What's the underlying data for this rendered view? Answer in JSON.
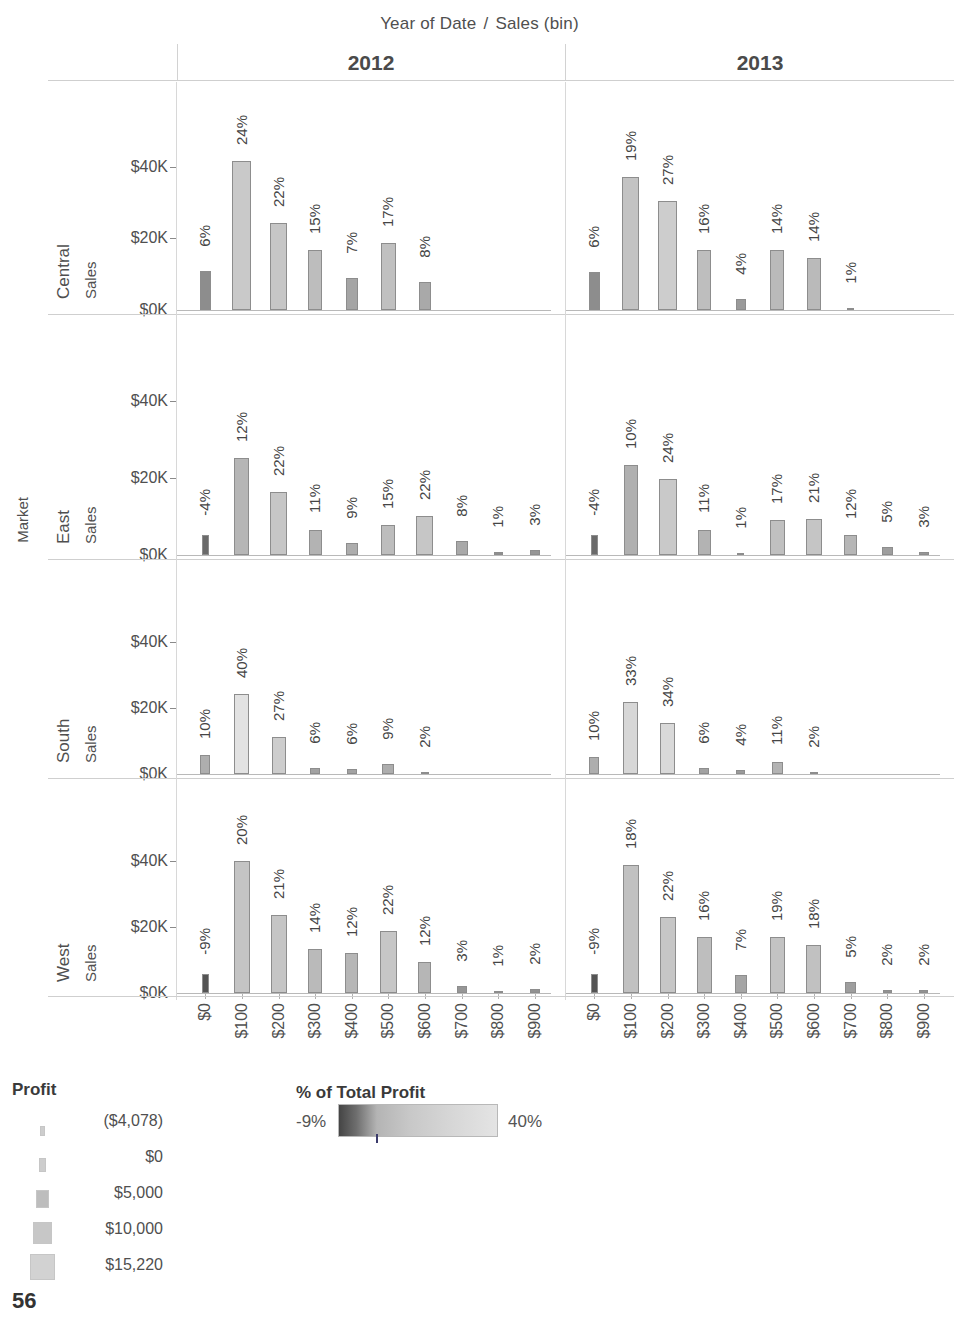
{
  "column_header": {
    "field_title": "Year of Date",
    "separator": "/",
    "bin_title": "Sales (bin)",
    "years": [
      "2012",
      "2013"
    ]
  },
  "row_header": {
    "field_title": "Market",
    "markets": [
      "Central",
      "East",
      "South",
      "West"
    ],
    "axis_title": "Sales"
  },
  "axes": {
    "y_ticks": [
      "$0K",
      "$20K",
      "$40K"
    ],
    "y_values": [
      0,
      20000,
      40000
    ],
    "x_ticks": [
      "$0",
      "$100",
      "$200",
      "$300",
      "$400",
      "$500",
      "$600",
      "$700",
      "$800",
      "$900"
    ]
  },
  "legend_profit": {
    "title": "Profit",
    "items": [
      {
        "label": "($4,078)",
        "width": 5
      },
      {
        "label": "$0",
        "width": 7
      },
      {
        "label": "$5,000",
        "width": 13
      },
      {
        "label": "$10,000",
        "width": 19
      },
      {
        "label": "$15,220",
        "width": 25
      }
    ]
  },
  "legend_color": {
    "title": "% of Total Profit",
    "min": "-9%",
    "max": "40%"
  },
  "page_number": "56",
  "chart_data": {
    "type": "bar",
    "xlabel": "Sales (bin)",
    "ylabel": "Sales",
    "ylim": [
      0,
      48000
    ],
    "grid": false,
    "legend_position": "bottom",
    "categories": [
      "$0",
      "$100",
      "$200",
      "$300",
      "$400",
      "$500",
      "$600",
      "$700",
      "$800",
      "$900"
    ],
    "row_field": "Market",
    "column_field": "Year of Date",
    "encodings": {
      "height": "Sales",
      "width": "Profit",
      "color": "% of Total Profit",
      "label": "% of Total Profit"
    },
    "panels": [
      {
        "market": "Central",
        "year": "2012",
        "bars": [
          {
            "x": "$0",
            "sales": 10800,
            "pct_label": "6%",
            "color": "#8d8d8d",
            "width": 11
          },
          {
            "x": "$100",
            "sales": 41500,
            "pct_label": "24%",
            "color": "#c9c9c9",
            "width": 19
          },
          {
            "x": "$200",
            "sales": 24200,
            "pct_label": "22%",
            "color": "#c6c6c6",
            "width": 17
          },
          {
            "x": "$300",
            "sales": 16700,
            "pct_label": "15%",
            "color": "#bdbdbd",
            "width": 14
          },
          {
            "x": "$400",
            "sales": 9000,
            "pct_label": "7%",
            "color": "#a5a5a5",
            "width": 12
          },
          {
            "x": "$500",
            "sales": 18800,
            "pct_label": "17%",
            "color": "#c0c0c0",
            "width": 15
          },
          {
            "x": "$600",
            "sales": 7800,
            "pct_label": "8%",
            "color": "#a9a9a9",
            "width": 12
          },
          {
            "x": "$700",
            "sales": 0,
            "pct_label": "",
            "color": "#bdbdbd",
            "width": 0
          },
          {
            "x": "$800",
            "sales": 0,
            "pct_label": "",
            "color": "#bdbdbd",
            "width": 0
          },
          {
            "x": "$900",
            "sales": 0,
            "pct_label": "",
            "color": "#bdbdbd",
            "width": 0
          }
        ]
      },
      {
        "market": "Central",
        "year": "2013",
        "bars": [
          {
            "x": "$0",
            "sales": 10500,
            "pct_label": "6%",
            "color": "#8d8d8d",
            "width": 11
          },
          {
            "x": "$100",
            "sales": 37200,
            "pct_label": "19%",
            "color": "#c3c3c3",
            "width": 17
          },
          {
            "x": "$200",
            "sales": 30500,
            "pct_label": "27%",
            "color": "#cdcdcd",
            "width": 19
          },
          {
            "x": "$300",
            "sales": 16700,
            "pct_label": "16%",
            "color": "#bebebe",
            "width": 14
          },
          {
            "x": "$400",
            "sales": 3000,
            "pct_label": "4%",
            "color": "#9a9a9a",
            "width": 10
          },
          {
            "x": "$500",
            "sales": 16700,
            "pct_label": "14%",
            "color": "#bababa",
            "width": 14
          },
          {
            "x": "$600",
            "sales": 14600,
            "pct_label": "14%",
            "color": "#bababa",
            "width": 14
          },
          {
            "x": "$700",
            "sales": 600,
            "pct_label": "1%",
            "color": "#8f8f8f",
            "width": 7
          },
          {
            "x": "$800",
            "sales": 0,
            "pct_label": "",
            "color": "#bdbdbd",
            "width": 0
          },
          {
            "x": "$900",
            "sales": 0,
            "pct_label": "",
            "color": "#bdbdbd",
            "width": 0
          }
        ]
      },
      {
        "market": "East",
        "year": "2012",
        "bars": [
          {
            "x": "$0",
            "sales": 5200,
            "pct_label": "-4%",
            "color": "#6a6a6a",
            "width": 7
          },
          {
            "x": "$100",
            "sales": 25200,
            "pct_label": "12%",
            "color": "#b6b6b6",
            "width": 15
          },
          {
            "x": "$200",
            "sales": 16300,
            "pct_label": "22%",
            "color": "#c6c6c6",
            "width": 17
          },
          {
            "x": "$300",
            "sales": 6400,
            "pct_label": "11%",
            "color": "#b3b3b3",
            "width": 13
          },
          {
            "x": "$400",
            "sales": 3000,
            "pct_label": "9%",
            "color": "#adadad",
            "width": 12
          },
          {
            "x": "$500",
            "sales": 7900,
            "pct_label": "15%",
            "color": "#bdbdbd",
            "width": 14
          },
          {
            "x": "$600",
            "sales": 10100,
            "pct_label": "22%",
            "color": "#c6c6c6",
            "width": 17
          },
          {
            "x": "$700",
            "sales": 3700,
            "pct_label": "8%",
            "color": "#a9a9a9",
            "width": 12
          },
          {
            "x": "$800",
            "sales": 800,
            "pct_label": "1%",
            "color": "#8f8f8f",
            "width": 9
          },
          {
            "x": "$900",
            "sales": 1300,
            "pct_label": "3%",
            "color": "#969696",
            "width": 10
          }
        ]
      },
      {
        "market": "East",
        "year": "2013",
        "bars": [
          {
            "x": "$0",
            "sales": 5300,
            "pct_label": "-4%",
            "color": "#6a6a6a",
            "width": 7
          },
          {
            "x": "$100",
            "sales": 23300,
            "pct_label": "10%",
            "color": "#b0b0b0",
            "width": 14
          },
          {
            "x": "$200",
            "sales": 19700,
            "pct_label": "24%",
            "color": "#c9c9c9",
            "width": 18
          },
          {
            "x": "$300",
            "sales": 6500,
            "pct_label": "11%",
            "color": "#b3b3b3",
            "width": 13
          },
          {
            "x": "$400",
            "sales": 600,
            "pct_label": "1%",
            "color": "#8f8f8f",
            "width": 7
          },
          {
            "x": "$500",
            "sales": 9100,
            "pct_label": "17%",
            "color": "#c0c0c0",
            "width": 15
          },
          {
            "x": "$600",
            "sales": 9400,
            "pct_label": "21%",
            "color": "#c5c5c5",
            "width": 16
          },
          {
            "x": "$700",
            "sales": 5300,
            "pct_label": "12%",
            "color": "#b6b6b6",
            "width": 13
          },
          {
            "x": "$800",
            "sales": 2000,
            "pct_label": "5%",
            "color": "#9e9e9e",
            "width": 11
          },
          {
            "x": "$900",
            "sales": 900,
            "pct_label": "3%",
            "color": "#969696",
            "width": 10
          }
        ]
      },
      {
        "market": "South",
        "year": "2012",
        "bars": [
          {
            "x": "$0",
            "sales": 5600,
            "pct_label": "10%",
            "color": "#aeaeae",
            "width": 10
          },
          {
            "x": "$100",
            "sales": 24200,
            "pct_label": "40%",
            "color": "#e2e2e2",
            "width": 15
          },
          {
            "x": "$200",
            "sales": 11300,
            "pct_label": "27%",
            "color": "#cdcdcd",
            "width": 14
          },
          {
            "x": "$300",
            "sales": 1700,
            "pct_label": "6%",
            "color": "#a2a2a2",
            "width": 10
          },
          {
            "x": "$400",
            "sales": 1600,
            "pct_label": "6%",
            "color": "#a2a2a2",
            "width": 10
          },
          {
            "x": "$500",
            "sales": 3000,
            "pct_label": "9%",
            "color": "#adadad",
            "width": 12
          },
          {
            "x": "$600",
            "sales": 500,
            "pct_label": "2%",
            "color": "#929292",
            "width": 8
          },
          {
            "x": "$700",
            "sales": 0,
            "pct_label": "",
            "color": "#bdbdbd",
            "width": 0
          },
          {
            "x": "$800",
            "sales": 0,
            "pct_label": "",
            "color": "#bdbdbd",
            "width": 0
          },
          {
            "x": "$900",
            "sales": 0,
            "pct_label": "",
            "color": "#bdbdbd",
            "width": 0
          }
        ]
      },
      {
        "market": "South",
        "year": "2013",
        "bars": [
          {
            "x": "$0",
            "sales": 5200,
            "pct_label": "10%",
            "color": "#aeaeae",
            "width": 10
          },
          {
            "x": "$100",
            "sales": 21600,
            "pct_label": "33%",
            "color": "#d7d7d7",
            "width": 15
          },
          {
            "x": "$200",
            "sales": 15500,
            "pct_label": "34%",
            "color": "#d9d9d9",
            "width": 15
          },
          {
            "x": "$300",
            "sales": 1800,
            "pct_label": "6%",
            "color": "#a2a2a2",
            "width": 10
          },
          {
            "x": "$400",
            "sales": 1100,
            "pct_label": "4%",
            "color": "#9a9a9a",
            "width": 9
          },
          {
            "x": "$500",
            "sales": 3500,
            "pct_label": "11%",
            "color": "#b3b3b3",
            "width": 11
          },
          {
            "x": "$600",
            "sales": 400,
            "pct_label": "2%",
            "color": "#929292",
            "width": 8
          },
          {
            "x": "$700",
            "sales": 0,
            "pct_label": "",
            "color": "#bdbdbd",
            "width": 0
          },
          {
            "x": "$800",
            "sales": 0,
            "pct_label": "",
            "color": "#bdbdbd",
            "width": 0
          },
          {
            "x": "$900",
            "sales": 0,
            "pct_label": "",
            "color": "#bdbdbd",
            "width": 0
          }
        ]
      },
      {
        "market": "West",
        "year": "2012",
        "bars": [
          {
            "x": "$0",
            "sales": 5800,
            "pct_label": "-9%",
            "color": "#545454",
            "width": 7
          },
          {
            "x": "$100",
            "sales": 39900,
            "pct_label": "20%",
            "color": "#c4c4c4",
            "width": 16
          },
          {
            "x": "$200",
            "sales": 23400,
            "pct_label": "21%",
            "color": "#c5c5c5",
            "width": 16
          },
          {
            "x": "$300",
            "sales": 13200,
            "pct_label": "14%",
            "color": "#bababa",
            "width": 14
          },
          {
            "x": "$400",
            "sales": 12200,
            "pct_label": "12%",
            "color": "#b6b6b6",
            "width": 13
          },
          {
            "x": "$500",
            "sales": 18600,
            "pct_label": "22%",
            "color": "#c6c6c6",
            "width": 17
          },
          {
            "x": "$600",
            "sales": 9500,
            "pct_label": "12%",
            "color": "#b6b6b6",
            "width": 13
          },
          {
            "x": "$700",
            "sales": 2000,
            "pct_label": "3%",
            "color": "#969696",
            "width": 10
          },
          {
            "x": "$800",
            "sales": 700,
            "pct_label": "1%",
            "color": "#8f8f8f",
            "width": 9
          },
          {
            "x": "$900",
            "sales": 1300,
            "pct_label": "2%",
            "color": "#929292",
            "width": 10
          }
        ]
      },
      {
        "market": "West",
        "year": "2013",
        "bars": [
          {
            "x": "$0",
            "sales": 5800,
            "pct_label": "-9%",
            "color": "#545454",
            "width": 7
          },
          {
            "x": "$100",
            "sales": 38600,
            "pct_label": "18%",
            "color": "#c1c1c1",
            "width": 16
          },
          {
            "x": "$200",
            "sales": 23000,
            "pct_label": "22%",
            "color": "#c6c6c6",
            "width": 16
          },
          {
            "x": "$300",
            "sales": 17000,
            "pct_label": "16%",
            "color": "#bebebe",
            "width": 15
          },
          {
            "x": "$400",
            "sales": 5400,
            "pct_label": "7%",
            "color": "#a5a5a5",
            "width": 12
          },
          {
            "x": "$500",
            "sales": 17000,
            "pct_label": "19%",
            "color": "#c3c3c3",
            "width": 15
          },
          {
            "x": "$600",
            "sales": 14400,
            "pct_label": "18%",
            "color": "#c1c1c1",
            "width": 15
          },
          {
            "x": "$700",
            "sales": 3200,
            "pct_label": "5%",
            "color": "#9e9e9e",
            "width": 11
          },
          {
            "x": "$800",
            "sales": 900,
            "pct_label": "2%",
            "color": "#929292",
            "width": 9
          },
          {
            "x": "$900",
            "sales": 900,
            "pct_label": "2%",
            "color": "#929292",
            "width": 9
          }
        ]
      }
    ]
  }
}
